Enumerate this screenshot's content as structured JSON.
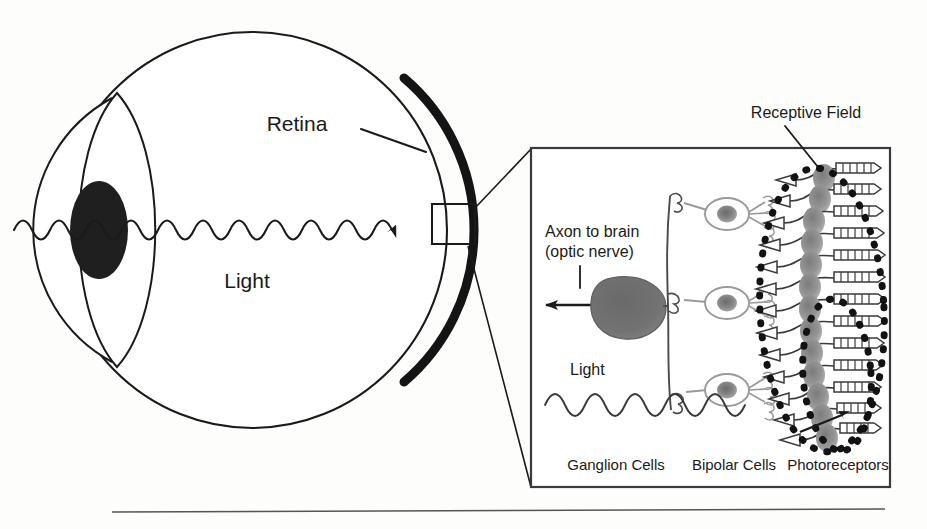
{
  "figure": {
    "background_color": "#fdfdfc",
    "ink_color": "#1a1a1a"
  },
  "eye": {
    "retina_label": "Retina",
    "light_label": "Light",
    "parts": {
      "sclera": "eyeball-outline",
      "retina_arc": "thick-retina-arc",
      "cornea": "cornea-arc",
      "lens": "lens-outline",
      "pupil": "pupil-ellipse",
      "light_ray": "light-sine-wave",
      "callout_box": "retina-sample-square"
    },
    "colors": {
      "retina_stroke": "#141414",
      "pupil_fill": "#1f1f1f",
      "outline_stroke": "#1a1a1a"
    }
  },
  "inset": {
    "receptive_field_label": "Receptive Field",
    "axon_label_line1": "Axon to brain",
    "axon_label_line2": "(optic nerve)",
    "light_label": "Light",
    "column_labels": [
      "Ganglion Cells",
      "Bipolar Cells",
      "Photoreceptors"
    ],
    "cell_counts": {
      "ganglion_cells": 1,
      "bipolar_cells": 3,
      "photoreceptors": 14
    },
    "receptive_field_ellipses": 2,
    "colors": {
      "panel_border": "#3a3a3a",
      "ganglion_fill": "#6e6e6e",
      "bipolar_stroke": "#9a9a9a",
      "nucleus_fill": "#8c8c8c",
      "photoreceptor_stroke": "#3a3a3a",
      "receptive_field_dots": "#121212"
    }
  },
  "footer": {
    "rule": "bottom-horizontal-rule"
  }
}
